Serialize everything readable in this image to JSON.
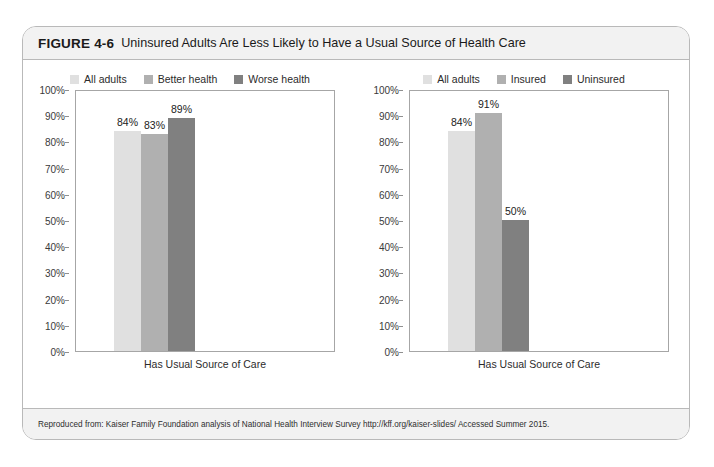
{
  "figure": {
    "number": "FIGURE 4-6",
    "title": "Uninsured Adults Are Less Likely to Have a Usual Source of Health Care",
    "source": "Reproduced from: Kaiser Family Foundation analysis of National Health Interview Survey http://kff.org/kaiser-slides/ Accessed Summer 2015."
  },
  "colors": {
    "series_light": "#e0e0e0",
    "series_medium": "#b0b0b0",
    "series_dark": "#808080",
    "card_border": "#b9b9b9",
    "band_background": "#f2f2f2",
    "axis_line": "#a6a6a6",
    "text": "#1a1a1a"
  },
  "chart_data": [
    {
      "type": "bar",
      "title": "",
      "panel": "left",
      "categories": [
        "Has Usual Source of Care"
      ],
      "xlabel": "Has Usual Source of Care",
      "ylabel": "",
      "ylim": [
        0,
        100
      ],
      "yticks": [
        "0%",
        "10%",
        "20%",
        "30%",
        "40%",
        "50%",
        "60%",
        "70%",
        "80%",
        "90%",
        "100%"
      ],
      "grid": false,
      "legend_position": "top-center",
      "series": [
        {
          "name": "All adults",
          "values": [
            84
          ],
          "labels": [
            "84%"
          ],
          "color": "#e0e0e0"
        },
        {
          "name": "Better health",
          "values": [
            83
          ],
          "labels": [
            "83%"
          ],
          "color": "#b0b0b0"
        },
        {
          "name": "Worse health",
          "values": [
            89
          ],
          "labels": [
            "89%"
          ],
          "color": "#808080"
        }
      ]
    },
    {
      "type": "bar",
      "title": "",
      "panel": "right",
      "categories": [
        "Has Usual Source of Care"
      ],
      "xlabel": "Has Usual Source of Care",
      "ylabel": "",
      "ylim": [
        0,
        100
      ],
      "yticks": [
        "0%",
        "10%",
        "20%",
        "30%",
        "40%",
        "50%",
        "60%",
        "70%",
        "80%",
        "90%",
        "100%"
      ],
      "grid": false,
      "legend_position": "top-center",
      "series": [
        {
          "name": "All adults",
          "values": [
            84
          ],
          "labels": [
            "84%"
          ],
          "color": "#e0e0e0"
        },
        {
          "name": "Insured",
          "values": [
            91
          ],
          "labels": [
            "91%"
          ],
          "color": "#b0b0b0"
        },
        {
          "name": "Uninsured",
          "values": [
            50
          ],
          "labels": [
            "50%"
          ],
          "color": "#808080"
        }
      ]
    }
  ]
}
